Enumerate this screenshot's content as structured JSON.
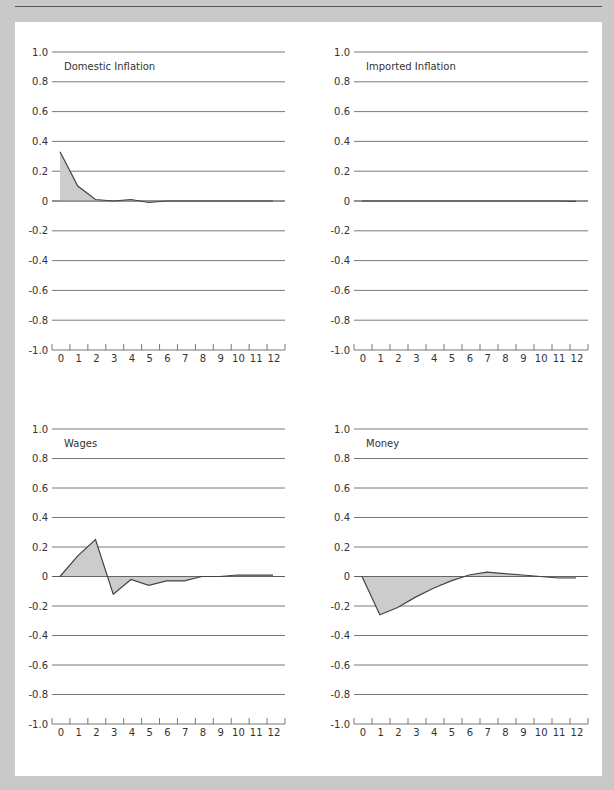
{
  "page": {
    "background_color": "#c9c9c9",
    "panel_color": "#ffffff",
    "grid_color": "#555555",
    "line_color": "#444444",
    "fill_color": "#cccccc"
  },
  "chart_data": [
    {
      "type": "area",
      "title": "Domestic Inflation",
      "x": [
        0,
        1,
        2,
        3,
        4,
        5,
        6,
        7,
        8,
        9,
        10,
        11,
        12
      ],
      "values": [
        0.33,
        0.1,
        0.01,
        0.0,
        0.01,
        -0.01,
        0.0,
        0.0,
        0.0,
        0.0,
        0.0,
        0.0,
        0.0
      ],
      "xlabel": "",
      "ylabel": "",
      "ylim": [
        -1.0,
        1.0
      ],
      "yticks": [
        "1.0",
        "0.8",
        "0.6",
        "0.4",
        "0.2",
        "0",
        "-0.2",
        "-0.4",
        "-0.6",
        "-0.8",
        "-1.0"
      ],
      "xticks": [
        "0",
        "1",
        "2",
        "3",
        "4",
        "5",
        "6",
        "7",
        "8",
        "9",
        "10",
        "11",
        "12"
      ],
      "grid": true
    },
    {
      "type": "area",
      "title": "Imported Inflation",
      "x": [
        0,
        1,
        2,
        3,
        4,
        5,
        6,
        7,
        8,
        9,
        10,
        11,
        12
      ],
      "values": [
        0.0,
        0.0,
        0.0,
        0.0,
        0.0,
        0.0,
        0.0,
        0.0,
        0.0,
        0.0,
        0.0,
        0.0,
        -0.003
      ],
      "xlabel": "",
      "ylabel": "",
      "ylim": [
        -1.0,
        1.0
      ],
      "yticks": [
        "1.0",
        "0.8",
        "0.6",
        "0.4",
        "0.2",
        "0",
        "-0.2",
        "-0.4",
        "-0.6",
        "-0.8",
        "-1.0"
      ],
      "xticks": [
        "0",
        "1",
        "2",
        "3",
        "4",
        "5",
        "6",
        "7",
        "8",
        "9",
        "10",
        "11",
        "12"
      ],
      "grid": true
    },
    {
      "type": "area",
      "title": "Wages",
      "x": [
        0,
        1,
        2,
        3,
        4,
        5,
        6,
        7,
        8,
        9,
        10,
        11,
        12
      ],
      "values": [
        0.0,
        0.14,
        0.25,
        -0.12,
        -0.02,
        -0.06,
        -0.03,
        -0.03,
        0.0,
        0.0,
        0.01,
        0.01,
        0.01
      ],
      "xlabel": "",
      "ylabel": "",
      "ylim": [
        -1.0,
        1.0
      ],
      "yticks": [
        "1.0",
        "0.8",
        "0.6",
        "0.4",
        "0.2",
        "0",
        "-0.2",
        "-0.4",
        "-0.6",
        "-0.8",
        "-1.0"
      ],
      "xticks": [
        "0",
        "1",
        "2",
        "3",
        "4",
        "5",
        "6",
        "7",
        "8",
        "9",
        "10",
        "11",
        "12"
      ],
      "grid": true
    },
    {
      "type": "area",
      "title": "Money",
      "x": [
        0,
        1,
        2,
        3,
        4,
        5,
        6,
        7,
        8,
        9,
        10,
        11,
        12
      ],
      "values": [
        0.0,
        -0.26,
        -0.21,
        -0.14,
        -0.08,
        -0.03,
        0.01,
        0.03,
        0.02,
        0.01,
        0.0,
        -0.01,
        -0.01
      ],
      "xlabel": "",
      "ylabel": "",
      "ylim": [
        -1.0,
        1.0
      ],
      "yticks": [
        "1.0",
        "0.8",
        "0.6",
        "0.4",
        "0.2",
        "0",
        "-0.2",
        "-0.4",
        "-0.6",
        "-0.8",
        "-1.0"
      ],
      "xticks": [
        "0",
        "1",
        "2",
        "3",
        "4",
        "5",
        "6",
        "7",
        "8",
        "9",
        "10",
        "11",
        "12"
      ],
      "grid": true
    }
  ]
}
